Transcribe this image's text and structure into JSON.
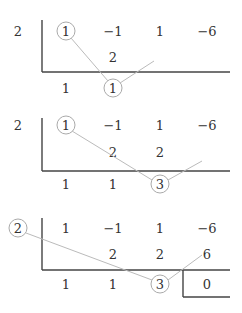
{
  "steps": [
    {
      "divisor": "2",
      "row1": [
        "1",
        "−1",
        "1",
        "−6"
      ],
      "row2": [
        "",
        "2",
        "",
        ""
      ],
      "row3": [
        "1",
        "1",
        "",
        ""
      ]
    },
    {
      "divisor": "2",
      "row1": [
        "1",
        "−1",
        "1",
        "−6"
      ],
      "row2": [
        "",
        "2",
        "2",
        ""
      ],
      "row3": [
        "1",
        "1",
        "3",
        ""
      ]
    },
    {
      "divisor": "2",
      "row1": [
        "1",
        "−1",
        "1",
        "−6"
      ],
      "row2": [
        "",
        "2",
        "2",
        "6"
      ],
      "row3": [
        "1",
        "1",
        "3",
        "0"
      ]
    }
  ],
  "colors": {
    "rule": "#444444",
    "highlight": "#aaaaaa",
    "text": "#333333"
  }
}
